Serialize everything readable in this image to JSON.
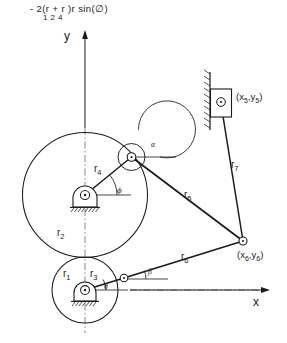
{
  "figure": {
    "title_formula": "- 2(r + r )r sin(∅)",
    "formula_subscripts": "1    2   4",
    "axes": {
      "y_label": "y",
      "x_label": "x"
    },
    "link_labels": {
      "r1": "r",
      "r1_sub": "1",
      "r2": "r",
      "r2_sub": "2",
      "r3": "r",
      "r3_sub": "3",
      "r4": "r",
      "r4_sub": "4",
      "r5": "r",
      "r5_sub": "5",
      "r6": "r",
      "r6_sub": "6",
      "r7": "r",
      "r7_sub": "7"
    },
    "angle_labels": {
      "alpha": "α",
      "phi": "ϕ",
      "theta": "θ",
      "beta": "β"
    },
    "point_labels": {
      "p5": "(x , y )",
      "p5_sub": "5     5",
      "p5_x": "x",
      "p5_y": "y",
      "p5_index": "5",
      "p6_x": "x",
      "p6_y": "y",
      "p6_index": "6"
    },
    "icons": {
      "ground_pivot": "ground-pivot-icon",
      "revolute_joint": "revolute-joint-icon",
      "slider_block": "slider-block-icon",
      "wall_hatch": "wall-hatching-icon",
      "axis_arrow": "axis-arrow-icon"
    },
    "colors": {
      "stroke": "#1a1a1a",
      "background": "#ffffff",
      "centerline": "#555555"
    }
  }
}
